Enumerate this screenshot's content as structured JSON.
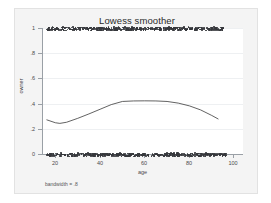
{
  "chart_data": {
    "type": "scatter",
    "title": "Lowess smoother",
    "xlabel": "age",
    "ylabel": "owner",
    "annotation": "bandwidth = .8",
    "xlim": [
      14,
      104
    ],
    "ylim": [
      0,
      1
    ],
    "xticks": [
      20,
      40,
      60,
      80,
      100
    ],
    "xtick_labels": [
      "20",
      "40",
      "60",
      "80",
      "100"
    ],
    "yticks": [
      0,
      0.2,
      0.4,
      0.6,
      0.8,
      1
    ],
    "ytick_labels": [
      "0",
      ".2",
      ".4",
      ".6",
      ".8",
      "1"
    ],
    "grid": true,
    "grid_axis": "y",
    "legend": "none",
    "marker_color": "#35373b",
    "line_color": "#3a3a3a",
    "series": [
      {
        "name": "owner",
        "type": "scatter",
        "note": "binary outcome; dense bands of observations at y=1 and y=0 spanning age 16 to 95",
        "band_top_y": 1,
        "band_top_x_range": [
          16,
          95
        ],
        "band_bottom_y": 0,
        "band_bottom_x_range": [
          16,
          96
        ]
      },
      {
        "name": "lowess smooth",
        "type": "line",
        "x": [
          16,
          20,
          22,
          25,
          30,
          35,
          40,
          45,
          50,
          55,
          60,
          65,
          70,
          75,
          80,
          85,
          90,
          93
        ],
        "values": [
          0.272,
          0.248,
          0.243,
          0.252,
          0.283,
          0.318,
          0.355,
          0.392,
          0.417,
          0.421,
          0.422,
          0.421,
          0.417,
          0.404,
          0.382,
          0.35,
          0.306,
          0.277
        ]
      }
    ]
  },
  "figure": {
    "bandwidth_label": "bandwidth = .8"
  }
}
